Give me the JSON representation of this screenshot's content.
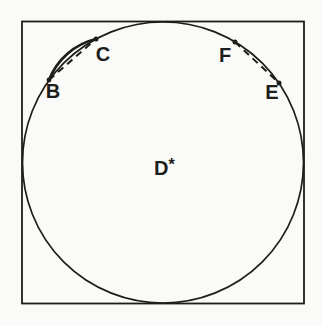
{
  "colors": {
    "paper": "#fafaf8",
    "ink": "#1d1d1b"
  },
  "figure": {
    "boundary_points": [
      {
        "label": "B"
      },
      {
        "label": "C"
      },
      {
        "label": "F"
      },
      {
        "label": "E"
      }
    ],
    "center_label": {
      "base": "D",
      "superscript": "*"
    }
  }
}
